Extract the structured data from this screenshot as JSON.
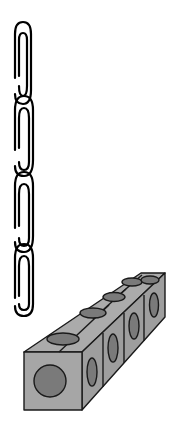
{
  "figure": {
    "description": "Illustration comparing a chain of paperclips with a row of connecting cubes",
    "paperclips": {
      "count": 4,
      "stroke_color": "#000000"
    },
    "cubes": {
      "count": 5,
      "face_color": "#a6a6a6",
      "dot_color": "#7a7a7a",
      "edge_color": "#1a1a1a"
    },
    "background": "#ffffff"
  }
}
